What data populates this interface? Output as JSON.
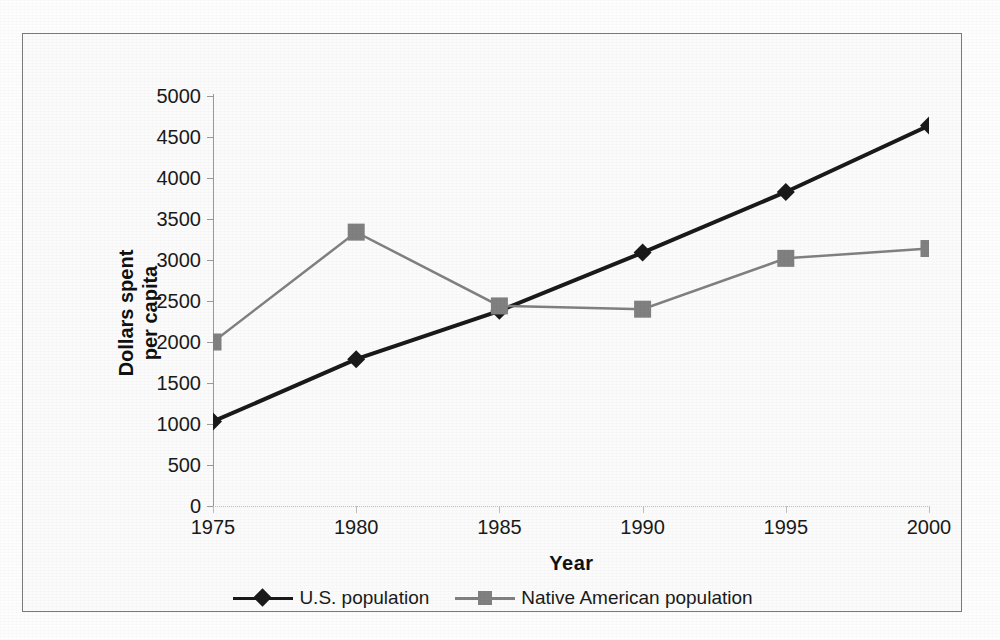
{
  "chart_data": {
    "type": "line",
    "title": "",
    "xlabel": "Year",
    "ylabel": "Dollars spent per capita",
    "ylabel_line1": "Dollars spent",
    "ylabel_line2": "per capita",
    "categories": [
      "1975",
      "1980",
      "1985",
      "1990",
      "1995",
      "2000"
    ],
    "x": [
      1975,
      1980,
      1985,
      1990,
      1995,
      2000
    ],
    "xlim": [
      1975,
      2000
    ],
    "ylim": [
      0,
      5000
    ],
    "ytick_values": [
      0,
      500,
      1000,
      1500,
      2000,
      2500,
      3000,
      3500,
      4000,
      4500,
      5000
    ],
    "ytick_labels": [
      "0",
      "500",
      "1000",
      "1500",
      "2000",
      "2500",
      "3000",
      "3500",
      "4000",
      "4500",
      "5000"
    ],
    "grid": false,
    "legend_position": "bottom",
    "series": [
      {
        "name": "U.S. population",
        "marker": "diamond",
        "color": "#1a1a1a",
        "values": [
          1030,
          1790,
          2380,
          3090,
          3830,
          4640
        ]
      },
      {
        "name": "Native American population",
        "marker": "square",
        "color": "#808080",
        "values": [
          2000,
          3340,
          2440,
          2400,
          3020,
          3140
        ]
      }
    ]
  },
  "legend": {
    "entries": [
      {
        "label": "U.S. population",
        "marker": "diamond-marker",
        "color": "#1a1a1a"
      },
      {
        "label": "Native American population",
        "marker": "square-marker",
        "color": "#808080"
      }
    ]
  },
  "axes": {
    "x_title": "Year",
    "y_title_line1": "Dollars spent",
    "y_title_line2": "per capita"
  },
  "colors": {
    "series_us": "#1a1a1a",
    "series_native": "#808080",
    "frame": "#7a7a7a",
    "axis": "#9a9a9a",
    "background": "#fbfbfb"
  }
}
